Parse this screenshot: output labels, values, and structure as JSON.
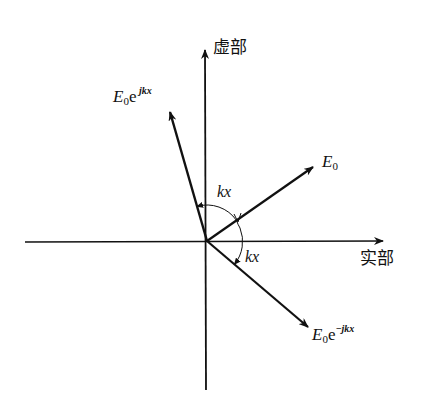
{
  "diagram": {
    "type": "complex-plane phasor diagram",
    "origin": [
      207,
      241
    ],
    "axes": {
      "imaginary": {
        "label": "虚部"
      },
      "real": {
        "label": "实部"
      }
    },
    "vectors": [
      {
        "name": "E0",
        "label_main": "E",
        "label_sub": "0",
        "label_exp": "",
        "tip": [
          313,
          167
        ]
      },
      {
        "name": "E0_e_jkx",
        "label_main": "E",
        "label_sub": "0",
        "label_base": "e",
        "label_exp": " jkx",
        "tip": [
          170,
          112
        ]
      },
      {
        "name": "E0_e_minus_jkx",
        "label_main": "E",
        "label_sub": "0",
        "label_base": "e",
        "label_exp": "−jkx",
        "tip": [
          308,
          327
        ]
      }
    ],
    "angles": [
      {
        "label": "kx",
        "between": [
          "E0",
          "E0_e_jkx"
        ]
      },
      {
        "label": "kx",
        "between": [
          "E0",
          "E0_e_minus_jkx"
        ]
      }
    ],
    "colors": {
      "ink": "#111111",
      "background": "#ffffff"
    }
  }
}
